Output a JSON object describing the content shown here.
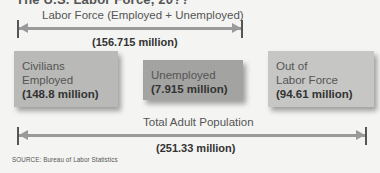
{
  "title_partial": "The U.S. Labor Force, 20??",
  "labor_force_arrow": {
    "label": "Labor Force (Employed + Unemployed)",
    "value": "(156.715 million)"
  },
  "boxes": [
    {
      "line1": "Civilians",
      "line2": "Employed",
      "value": "(148.8 million)",
      "color": "#b9b9b7"
    },
    {
      "line1": "Unemployed",
      "line2": "",
      "value": "(7.915 million)",
      "color": "#a3a3a1"
    },
    {
      "line1": "Out of",
      "line2": "Labor Force",
      "value": "(94.61 million)",
      "color": "#c6c6c4"
    }
  ],
  "population_arrow": {
    "label": "Total Adult Population",
    "value": "(251.33 million)"
  },
  "source": "SOURCE: Bureau of Labor Statistics"
}
